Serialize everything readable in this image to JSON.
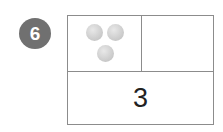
{
  "problem": {
    "number": "6"
  },
  "part_whole_box": {
    "top_left": {
      "dots": 3
    },
    "top_right": {
      "value": ""
    },
    "bottom": {
      "value": "3"
    }
  },
  "colors": {
    "badge": "#707070",
    "border": "#8c8c8c",
    "dot": "#c9c9c9"
  }
}
